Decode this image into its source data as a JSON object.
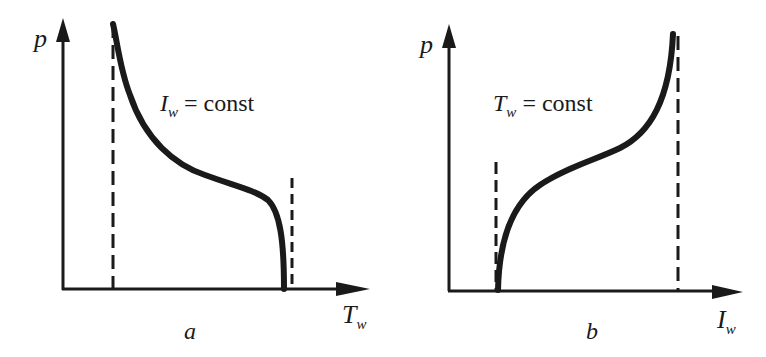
{
  "diagrams": [
    {
      "id": "a",
      "panel_label": "a",
      "y_axis_label": "p",
      "x_axis_label_main": "T",
      "x_axis_label_sub": "w",
      "annotation_main": "I",
      "annotation_sub": "w",
      "annotation_rest": " = const",
      "curve_description": "p decreasing with T_w at constant I_w; steep near left asymptote, plateau, then drop to zero near right limit",
      "dashed_lines": [
        "left vertical asymptote",
        "right vertical limit"
      ]
    },
    {
      "id": "b",
      "panel_label": "b",
      "y_axis_label": "p",
      "x_axis_label_main": "I",
      "x_axis_label_sub": "w",
      "annotation_main": "T",
      "annotation_sub": "w",
      "annotation_rest": " = const",
      "curve_description": "p increasing with I_w at constant T_w; rises from zero at left limit, inflects, steep near right asymptote",
      "dashed_lines": [
        "left vertical limit",
        "right vertical asymptote"
      ]
    }
  ],
  "colors": {
    "ink": "#1a1a1a",
    "background": "#ffffff"
  }
}
